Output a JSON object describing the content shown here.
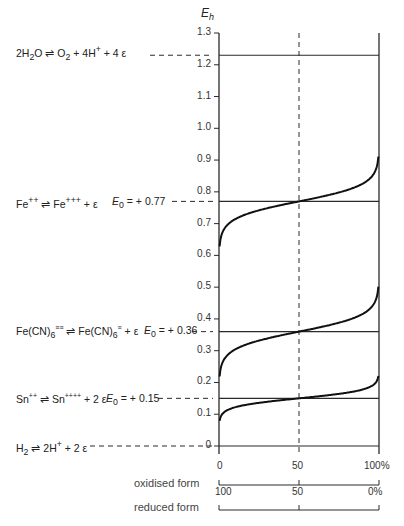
{
  "chart_data": {
    "type": "line",
    "title": "",
    "ylabel": "Eh",
    "ylim": [
      0,
      1.3
    ],
    "yticks": [
      "1.3",
      "1.2",
      "1.1",
      "1.0",
      "0.9",
      "0.8",
      "0.7",
      "0.6",
      "0.5",
      "0.4",
      "0.3",
      "0.2",
      "0.1",
      "0"
    ],
    "x_axes": [
      {
        "label": "oxidised form",
        "ticks": [
          "0",
          "50",
          "100%"
        ]
      },
      {
        "label": "reduced form",
        "ticks": [
          "100",
          "50",
          "0%"
        ]
      }
    ],
    "midline_x": 50,
    "reference_lines": [
      {
        "equation": "2H2O ⇌ O2 + 4H+ + 4ε",
        "value": 1.23,
        "e0_label": ""
      },
      {
        "equation": "Fe++ ⇌ Fe+++ + ε",
        "value": 0.77,
        "e0_label": "E0 = +0.77"
      },
      {
        "equation": "Fe(CN)6≡≡ ⇌ Fe(CN)6≡ + ε",
        "value": 0.36,
        "e0_label": "E0 = +0.36"
      },
      {
        "equation": "Sn++ ⇌ Sn++++ + 2ε",
        "value": 0.15,
        "e0_label": "E0 = +0.15"
      },
      {
        "equation": "H2 ⇌ 2H+ + 2ε",
        "value": 0.0,
        "e0_label": ""
      }
    ],
    "series": [
      {
        "name": "Fe++/Fe+++",
        "e0": 0.77,
        "n": 1,
        "x": [
          0.5,
          10,
          50,
          90,
          99.5
        ],
        "y": [
          0.55,
          0.72,
          0.77,
          0.83,
          0.96
        ]
      },
      {
        "name": "Fe(CN)6",
        "e0": 0.36,
        "n": 1,
        "x": [
          0.5,
          10,
          50,
          90,
          99.5
        ],
        "y": [
          0.16,
          0.31,
          0.36,
          0.42,
          0.55
        ]
      },
      {
        "name": "Sn++/Sn++++",
        "e0": 0.15,
        "n": 2,
        "x": [
          0.5,
          10,
          50,
          90,
          99.5
        ],
        "y": [
          0.03,
          0.12,
          0.15,
          0.18,
          0.32
        ]
      }
    ]
  },
  "labels": {
    "ylabel_main": "E",
    "ylabel_sub": "h",
    "water": {
      "pre": "2H",
      "sub1": "2",
      "mid": "O ⇌ O",
      "sub2": "2",
      "post": " + 4H",
      "sup": "+",
      "end": " + 4 ε"
    },
    "fe": {
      "a": "Fe",
      "a_sup": "++",
      "arrow": " ⇌ ",
      "b": "Fe",
      "b_sup": "+++",
      "end": " + ε",
      "e0": "E",
      "e0_sub": "0",
      "e0_val": " = + 0.77"
    },
    "fecn": {
      "a": "Fe(CN)",
      "a_sub": "6",
      "a_sup": "≡≡",
      "arrow": " ⇌ ",
      "b": "Fe(CN)",
      "b_sub": "6",
      "b_sup": "≡",
      "end": " + ε",
      "e0": "E",
      "e0_sub": "0",
      "e0_val": " = + 0.36"
    },
    "sn": {
      "a": "Sn",
      "a_sup": "++",
      "arrow": " ⇌ ",
      "b": "Sn",
      "b_sup": "++++",
      "end": " + 2 ε",
      "e0": "E",
      "e0_sub": "0",
      "e0_val": " = + 0.15"
    },
    "h2": {
      "a": "H",
      "a_sub": "2",
      "arrow": " ⇌ ",
      "b": "2H",
      "b_sup": "+",
      "end": " + 2 ε"
    },
    "ox_label": "oxidised form",
    "red_label": "reduced form",
    "ox_ticks": [
      "0",
      "50",
      "100%"
    ],
    "red_ticks": [
      "100",
      "50",
      "0%"
    ]
  }
}
